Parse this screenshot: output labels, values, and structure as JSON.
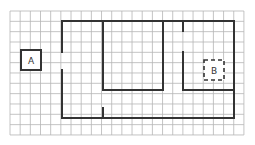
{
  "grid": {
    "origin_x": 10,
    "origin_y": 11,
    "cols": 23,
    "rows": 12,
    "cell_w": 10.17,
    "cell_h": 10.33,
    "line_color": "#b5b5b5",
    "wall_color": "#333333"
  },
  "walls": [
    {
      "x1": 62,
      "y1": 21,
      "x2": 234,
      "y2": 21
    },
    {
      "x1": 62,
      "y1": 21,
      "x2": 62,
      "y2": 52
    },
    {
      "x1": 62,
      "y1": 70,
      "x2": 62,
      "y2": 118
    },
    {
      "x1": 62,
      "y1": 118,
      "x2": 234,
      "y2": 118
    },
    {
      "x1": 234,
      "y1": 21,
      "x2": 234,
      "y2": 118
    },
    {
      "x1": 103,
      "y1": 21,
      "x2": 103,
      "y2": 90
    },
    {
      "x1": 103,
      "y1": 90,
      "x2": 163,
      "y2": 90
    },
    {
      "x1": 163,
      "y1": 21,
      "x2": 163,
      "y2": 90
    },
    {
      "x1": 183,
      "y1": 21,
      "x2": 183,
      "y2": 31
    },
    {
      "x1": 183,
      "y1": 52,
      "x2": 183,
      "y2": 90
    },
    {
      "x1": 183,
      "y1": 90,
      "x2": 234,
      "y2": 90
    },
    {
      "x1": 103,
      "y1": 108,
      "x2": 103,
      "y2": 118
    }
  ],
  "box_a": {
    "label": "A",
    "x": 21,
    "y": 50,
    "w": 20,
    "h": 20,
    "style": "solid"
  },
  "box_b": {
    "label": "B",
    "x": 204,
    "y": 60,
    "w": 20,
    "h": 20,
    "style": "dashed"
  }
}
